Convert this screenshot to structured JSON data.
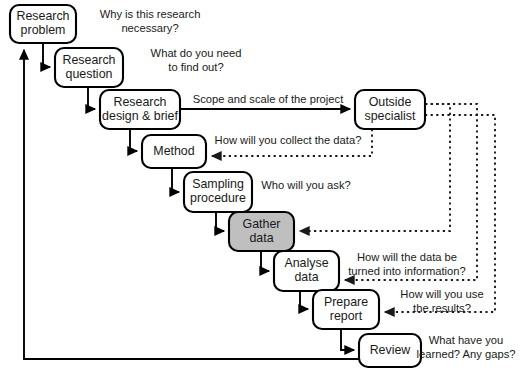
{
  "diagram": {
    "colors": {
      "stroke": "#000000",
      "node_fill": "#ffffff",
      "highlight_fill": "#bfbfbf",
      "text": "#1a1a1a"
    },
    "nodes": [
      {
        "id": "research-problem",
        "label_lines": [
          "Research",
          "problem"
        ],
        "x": 10,
        "y": 5,
        "w": 66,
        "h": 38,
        "shaded": false
      },
      {
        "id": "research-question",
        "label_lines": [
          "Research",
          "question"
        ],
        "x": 55,
        "y": 48,
        "w": 68,
        "h": 39,
        "shaded": false
      },
      {
        "id": "research-design",
        "label_lines": [
          "Research",
          "design & brief"
        ],
        "x": 100,
        "y": 90,
        "w": 80,
        "h": 39,
        "shaded": false
      },
      {
        "id": "method",
        "label_lines": [
          "Method"
        ],
        "x": 142,
        "y": 135,
        "w": 64,
        "h": 33,
        "shaded": false
      },
      {
        "id": "sampling",
        "label_lines": [
          "Sampling",
          "procedure"
        ],
        "x": 184,
        "y": 172,
        "w": 68,
        "h": 40,
        "shaded": false
      },
      {
        "id": "gather-data",
        "label_lines": [
          "Gather",
          "data"
        ],
        "x": 229,
        "y": 212,
        "w": 65,
        "h": 39,
        "shaded": true
      },
      {
        "id": "analyse-data",
        "label_lines": [
          "Analyse",
          "data"
        ],
        "x": 274,
        "y": 251,
        "w": 65,
        "h": 40,
        "shaded": false
      },
      {
        "id": "prepare-report",
        "label_lines": [
          "Prepare",
          "report"
        ],
        "x": 313,
        "y": 290,
        "w": 66,
        "h": 39,
        "shaded": false
      },
      {
        "id": "review",
        "label_lines": [
          "Review"
        ],
        "x": 359,
        "y": 334,
        "w": 62,
        "h": 33,
        "shaded": false
      },
      {
        "id": "outside-specialist",
        "label_lines": [
          "Outside",
          "specialist"
        ],
        "x": 355,
        "y": 90,
        "w": 70,
        "h": 39,
        "shaded": false
      }
    ],
    "annotations": [
      {
        "id": "why-necessary",
        "lines": [
          "Why is this research",
          "necessary?"
        ],
        "cx": 150,
        "cy": 22,
        "align": "center"
      },
      {
        "id": "what-find-out",
        "lines": [
          "What do you need",
          "to find out?"
        ],
        "cx": 196,
        "cy": 61,
        "align": "center"
      },
      {
        "id": "scope-scale",
        "lines": [
          "Scope and scale of the project"
        ],
        "cx": 268,
        "cy": 100,
        "align": "center"
      },
      {
        "id": "how-collect-data",
        "lines": [
          "How will you collect the data?"
        ],
        "cx": 288,
        "cy": 141,
        "align": "center"
      },
      {
        "id": "who-will-you-ask",
        "lines": [
          "Who will you ask?"
        ],
        "cx": 306,
        "cy": 186,
        "align": "center"
      },
      {
        "id": "how-data-information",
        "lines": [
          "How will the data be",
          "turned into information?"
        ],
        "cx": 407,
        "cy": 265,
        "align": "center"
      },
      {
        "id": "how-use-results",
        "lines": [
          "How will you use",
          "the results?"
        ],
        "cx": 442,
        "cy": 302,
        "align": "center"
      },
      {
        "id": "what-learned-gaps",
        "lines": [
          "What have you",
          "learned? Any gaps?"
        ],
        "cx": 466,
        "cy": 348,
        "align": "center"
      }
    ],
    "solid_edges": [
      {
        "id": "problem-to-question",
        "d": "M 43 43 L 43 67 L 50 67",
        "arrow": true
      },
      {
        "id": "question-to-design",
        "d": "M 88 87 L 88 109 L 95 109",
        "arrow": true
      },
      {
        "id": "design-to-method",
        "d": "M 130 129 L 130 151 L 137 151",
        "arrow": true
      },
      {
        "id": "method-to-sampling",
        "d": "M 172 168 L 172 192 L 179 192",
        "arrow": true
      },
      {
        "id": "sampling-to-gather",
        "d": "M 216 212 L 216 231 L 224 231",
        "arrow": true
      },
      {
        "id": "gather-to-analyse",
        "d": "M 261 251 L 261 271 L 269 271",
        "arrow": true
      },
      {
        "id": "analyse-to-prepare",
        "d": "M 300 291 L 300 309 L 308 309",
        "arrow": true
      },
      {
        "id": "prepare-to-review",
        "d": "M 341 329 L 341 350 L 354 350",
        "arrow": true
      },
      {
        "id": "design-to-specialist",
        "d": "M 180 109 L 350 109",
        "arrow": true
      },
      {
        "id": "review-back-to-problem",
        "d": "M 359 359 L 24 359 L 24 50",
        "arrow": true
      }
    ],
    "dotted_edges": [
      {
        "id": "specialist-to-method",
        "d": "M 372 129 L 372 156 L 212 156",
        "arrow": true
      },
      {
        "id": "specialist-to-gather",
        "d": "M 390 108 L 390 104 L 450 104 L 450 231 L 300 231",
        "arrow": true
      },
      {
        "id": "specialist-to-analyse",
        "d": "M 425 104 L 477 104 L 477 280 L 345 280",
        "arrow": true
      },
      {
        "id": "specialist-to-prepare",
        "d": "M 425 115 L 495 115 L 495 312 L 385 312",
        "arrow": true
      }
    ]
  }
}
